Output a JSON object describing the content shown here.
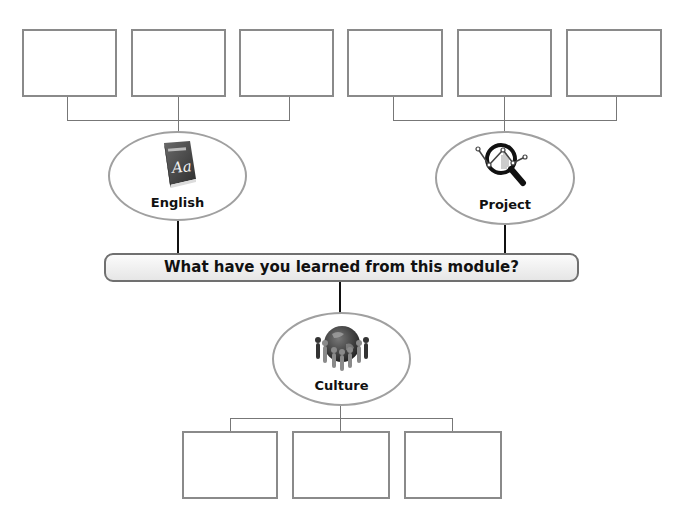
{
  "title": "What have you learned from this module?",
  "topics": [
    {
      "id": "english",
      "label": "English",
      "icon": "dictionary-book-icon",
      "icon_text": "Aa",
      "icon_caption": "DICTIONARY"
    },
    {
      "id": "project",
      "label": "Project",
      "icon": "magnifier-chart-icon"
    },
    {
      "id": "culture",
      "label": "Culture",
      "icon": "globe-people-icon"
    }
  ],
  "answer_boxes": {
    "english": [
      "",
      "",
      ""
    ],
    "project": [
      "",
      "",
      ""
    ],
    "culture": [
      "",
      "",
      ""
    ]
  },
  "colors": {
    "box_border": "#8a8a8a",
    "connector": "#777777",
    "stem": "#111111",
    "banner_fill_top": "#fbfbfb",
    "banner_fill_bottom": "#e6e6e6"
  }
}
